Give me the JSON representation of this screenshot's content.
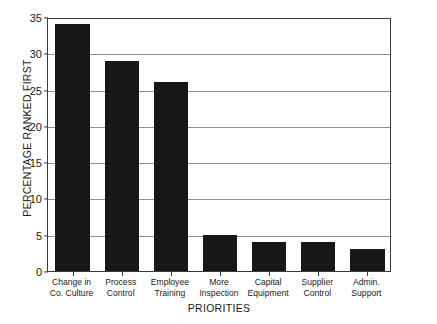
{
  "chart_data": {
    "type": "bar",
    "title": "",
    "xlabel": "PRIORITIES",
    "ylabel": "PERCENTAGE RANKED FIRST",
    "categories": [
      "Change in Co. Culture",
      "Process Control",
      "Employee Training",
      "More Inspection",
      "Capital Equipment",
      "Supplier Control",
      "Admin. Support"
    ],
    "category_lines": [
      [
        "Change in",
        "Co. Culture"
      ],
      [
        "Process",
        "Control"
      ],
      [
        "Employee",
        "Training"
      ],
      [
        "More",
        "Inspection"
      ],
      [
        "Capital",
        "Equipment"
      ],
      [
        "Supplier",
        "Control"
      ],
      [
        "Admin.",
        "Support"
      ]
    ],
    "values": [
      34,
      29,
      26,
      5,
      4,
      4,
      3
    ],
    "ylim": [
      0,
      35
    ],
    "ytick_labels": [
      "35",
      "30",
      "25",
      "20",
      "15",
      "10",
      "5",
      "0"
    ],
    "ytick_values": [
      35,
      30,
      25,
      20,
      15,
      10,
      5,
      0
    ],
    "grid": true,
    "legend": false,
    "bar_color": "#171717",
    "grid_color": "#8d8d8d",
    "axis_color": "#3a3a3a"
  }
}
